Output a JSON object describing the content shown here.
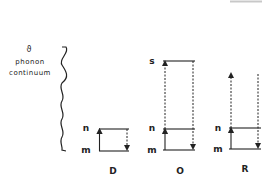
{
  "diagram": {
    "type": "energy-level-diagram",
    "colors": {
      "ink": "#222222",
      "artifact": "#c8c8c8"
    },
    "continuum": {
      "symbol": "ϑ",
      "line1": "phonon",
      "line2": "continuum"
    },
    "levels": {
      "upper": "n",
      "lower": "m",
      "virtual": "s"
    },
    "panels": [
      {
        "id": "D",
        "label": "D",
        "levels": [
          "m",
          "n"
        ],
        "absorption": "m→n (solid, up)",
        "emission": "n→m (dashed, down)"
      },
      {
        "id": "O",
        "label": "O",
        "levels": [
          "m",
          "n",
          "s"
        ],
        "absorption": "m→s (solid to n, dashed to s, up)",
        "emission": "s→m (dashed, down)"
      },
      {
        "id": "R",
        "label": "R",
        "levels": [
          "m",
          "n"
        ],
        "absorption": "m→ continuum (solid to n, dashed up, open)",
        "emission": "continuum → m (dashed, down)"
      }
    ]
  }
}
